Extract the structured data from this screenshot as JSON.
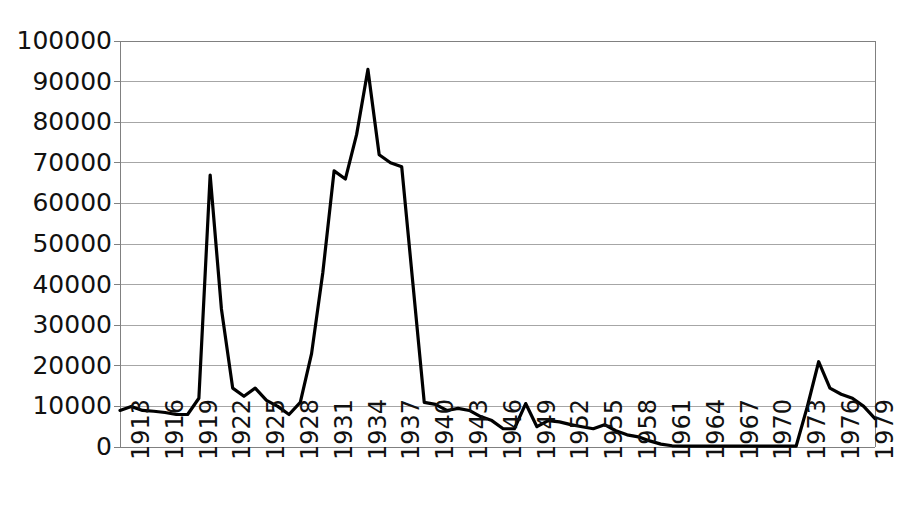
{
  "chart_data": {
    "type": "line",
    "title": "",
    "subtitle": "",
    "xlabel": "",
    "ylabel": "",
    "xlim": [
      1913,
      1980
    ],
    "ylim": [
      0,
      100000
    ],
    "grid": true,
    "legend": false,
    "line_color": "#000000",
    "grid_color": "#a6a6a6",
    "axis_color": "#808080",
    "background_color": "#ffffff",
    "y_ticks": [
      "0",
      "10000",
      "20000",
      "30000",
      "40000",
      "50000",
      "60000",
      "70000",
      "80000",
      "90000",
      "100000"
    ],
    "y_tick_values": [
      0,
      10000,
      20000,
      30000,
      40000,
      50000,
      60000,
      70000,
      80000,
      90000,
      100000
    ],
    "x_ticks": [
      "1913",
      "1916",
      "1919",
      "1922",
      "1925",
      "1928",
      "1931",
      "1934",
      "1937",
      "1940",
      "1943",
      "1946",
      "1949",
      "1952",
      "1955",
      "1958",
      "1961",
      "1964",
      "1967",
      "1970",
      "1973",
      "1976",
      "1979"
    ],
    "x_tick_values": [
      1913,
      1916,
      1919,
      1922,
      1925,
      1928,
      1931,
      1934,
      1937,
      1940,
      1943,
      1946,
      1949,
      1952,
      1955,
      1958,
      1961,
      1964,
      1967,
      1970,
      1973,
      1976,
      1979
    ],
    "x": [
      1913,
      1914,
      1915,
      1916,
      1917,
      1918,
      1919,
      1920,
      1921,
      1922,
      1923,
      1924,
      1925,
      1926,
      1927,
      1928,
      1929,
      1930,
      1931,
      1932,
      1933,
      1934,
      1935,
      1936,
      1937,
      1938,
      1939,
      1940,
      1941,
      1942,
      1943,
      1944,
      1945,
      1946,
      1947,
      1948,
      1949,
      1950,
      1951,
      1952,
      1953,
      1954,
      1955,
      1956,
      1957,
      1958,
      1959,
      1960,
      1961,
      1962,
      1963,
      1964,
      1965,
      1966,
      1967,
      1968,
      1969,
      1970,
      1971,
      1972,
      1973,
      1974,
      1975,
      1976,
      1977,
      1978,
      1979,
      1980
    ],
    "values": [
      9000,
      10000,
      9000,
      8800,
      8500,
      8000,
      8000,
      12000,
      67000,
      34000,
      14500,
      12500,
      14500,
      11500,
      10000,
      8000,
      11000,
      23000,
      43000,
      68000,
      66000,
      77000,
      93000,
      72000,
      70000,
      69000,
      40000,
      11000,
      10500,
      9000,
      9500,
      9000,
      7500,
      6500,
      4500,
      4500,
      10700,
      5000,
      6500,
      6200,
      5500,
      5000,
      4500,
      5500,
      4000,
      3000,
      2500,
      1500,
      700,
      300,
      200,
      200,
      200,
      200,
      200,
      200,
      200,
      200,
      200,
      200,
      200,
      10000,
      21000,
      14500,
      13000,
      12000,
      10000,
      7000
    ],
    "series_name": ""
  },
  "geometry": {
    "plot_left": 120,
    "plot_right": 875,
    "plot_top": 41,
    "plot_bottom": 447
  }
}
